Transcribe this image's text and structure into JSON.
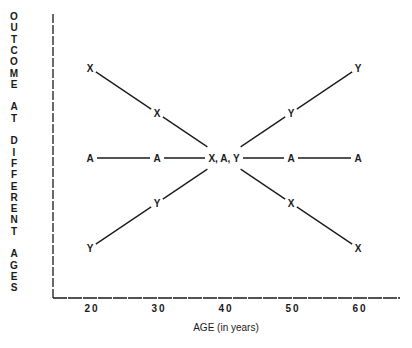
{
  "chart_data": {
    "type": "line",
    "title": "",
    "xlabel": "AGE (in years)",
    "ylabel": "OUTCOME AT DIFFERENT AGES",
    "x": [
      20,
      30,
      40,
      50,
      60
    ],
    "x_ticks": [
      "20",
      "30",
      "40",
      "50",
      "60"
    ],
    "y_ticks": [],
    "ylim": [
      0.5,
      5.5
    ],
    "grid": false,
    "legend": null,
    "series": [
      {
        "name": "X",
        "marker": "X",
        "values": [
          5,
          4,
          3,
          2,
          1
        ]
      },
      {
        "name": "A",
        "marker": "A",
        "values": [
          3,
          3,
          3,
          3,
          3
        ]
      },
      {
        "name": "Y",
        "marker": "Y",
        "values": [
          1,
          2,
          3,
          4,
          5
        ]
      }
    ],
    "annotations": [
      {
        "x": 40,
        "y": 3,
        "text": "X, A, Y"
      }
    ]
  },
  "axes": {
    "ylabel_lines": [
      "OUTCOME",
      "AT",
      "DIFFERENT",
      "AGES"
    ],
    "xlabel": "AGE (in years)"
  }
}
